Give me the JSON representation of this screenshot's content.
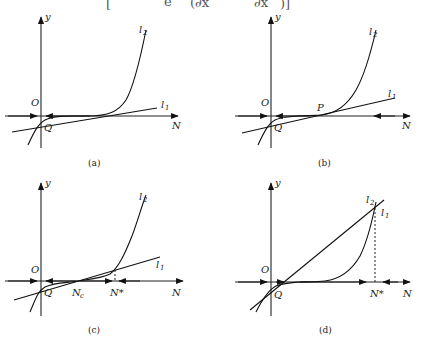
{
  "equation_fragment": {
    "visible": "[ e ( ∂x ∂x ) ]",
    "left_bracket": "[",
    "right_bracket": ")]",
    "mid1": "e",
    "mid2": "(∂x",
    "mid3": "∂x"
  },
  "panels": [
    {
      "caption": "(a)",
      "axis_y_label": "y",
      "axis_x_label": "N",
      "origin_label": "O",
      "point_q_label": "Q",
      "line1_label": "l",
      "line1_sub": "1",
      "line2_label": "l",
      "line2_sub": "2"
    },
    {
      "caption": "(b)",
      "axis_y_label": "y",
      "axis_x_label": "N",
      "origin_label": "O",
      "point_q_label": "Q",
      "point_p_label": "P",
      "line1_label": "l",
      "line1_sub": "1",
      "line2_label": "l",
      "line2_sub": "2"
    },
    {
      "caption": "(c)",
      "axis_y_label": "y",
      "axis_x_label": "N",
      "origin_label": "O",
      "point_q_label": "Q",
      "point_nc_label": "N",
      "point_nc_sub": "c",
      "point_nstar_label": "N*",
      "line1_label": "l",
      "line1_sub": "1",
      "line2_label": "l",
      "line2_sub": "2"
    },
    {
      "caption": "(d)",
      "axis_y_label": "y",
      "axis_x_label": "N",
      "origin_label": "O",
      "point_q_label": "Q",
      "point_nstar_label": "N*",
      "line1_label": "l",
      "line1_sub": "1",
      "line2_label": "l",
      "line2_sub": "2"
    }
  ],
  "colors": {
    "stroke": "#111111",
    "background": "#ffffff"
  }
}
